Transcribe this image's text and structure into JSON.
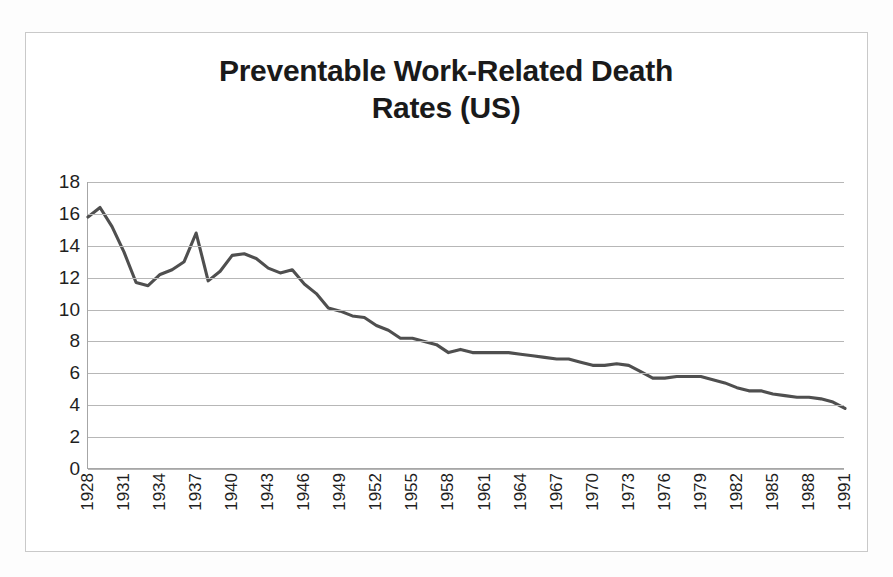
{
  "figure": {
    "title_line1": "Preventable Work-Related Death",
    "title_line2": "Rates (US)",
    "border_color": "#c9c9c9",
    "background_color": "#ffffff"
  },
  "chart_data": {
    "type": "line",
    "title": "Preventable Work-Related Death Rates (US)",
    "xlabel": "",
    "ylabel": "",
    "xlim": [
      1928,
      1991
    ],
    "ylim": [
      0,
      18
    ],
    "y_ticks": [
      0,
      2,
      4,
      6,
      8,
      10,
      12,
      14,
      16,
      18
    ],
    "y_tick_labels": [
      "0",
      "2",
      "4",
      "6",
      "8",
      "10",
      "12",
      "14",
      "16",
      "18"
    ],
    "x_tick_labels": [
      "1928",
      "1931",
      "1934",
      "1937",
      "1940",
      "1943",
      "1946",
      "1949",
      "1952",
      "1955",
      "1958",
      "1961",
      "1964",
      "1967",
      "1970",
      "1973",
      "1976",
      "1979",
      "1982",
      "1985",
      "1988",
      "1991"
    ],
    "x_tick_interval": 3,
    "grid": "horizontal",
    "legend": "none",
    "line_color": "#4f4f4f",
    "line_width": 3.1,
    "x": [
      1928,
      1929,
      1930,
      1931,
      1932,
      1933,
      1934,
      1935,
      1936,
      1937,
      1938,
      1939,
      1940,
      1941,
      1942,
      1943,
      1944,
      1945,
      1946,
      1947,
      1948,
      1949,
      1950,
      1951,
      1952,
      1953,
      1954,
      1955,
      1956,
      1957,
      1958,
      1959,
      1960,
      1961,
      1962,
      1963,
      1964,
      1965,
      1966,
      1967,
      1968,
      1969,
      1970,
      1971,
      1972,
      1973,
      1974,
      1975,
      1976,
      1977,
      1978,
      1979,
      1980,
      1981,
      1982,
      1983,
      1984,
      1985,
      1986,
      1987,
      1988,
      1989,
      1990,
      1991
    ],
    "values": [
      15.8,
      16.4,
      15.2,
      13.6,
      11.7,
      11.5,
      12.2,
      12.5,
      13.0,
      14.8,
      11.8,
      12.4,
      13.4,
      13.5,
      13.2,
      12.6,
      12.3,
      12.5,
      11.6,
      11.0,
      10.1,
      9.9,
      9.6,
      9.5,
      9.0,
      8.7,
      8.2,
      8.2,
      8.0,
      7.8,
      7.3,
      7.5,
      7.3,
      7.3,
      7.3,
      7.3,
      7.2,
      7.1,
      7.0,
      6.9,
      6.9,
      6.7,
      6.5,
      6.5,
      6.6,
      6.5,
      6.1,
      5.7,
      5.7,
      5.8,
      5.8,
      5.8,
      5.6,
      5.4,
      5.1,
      4.9,
      4.9,
      4.7,
      4.6,
      4.5,
      4.5,
      4.4,
      4.2,
      3.8
    ]
  }
}
